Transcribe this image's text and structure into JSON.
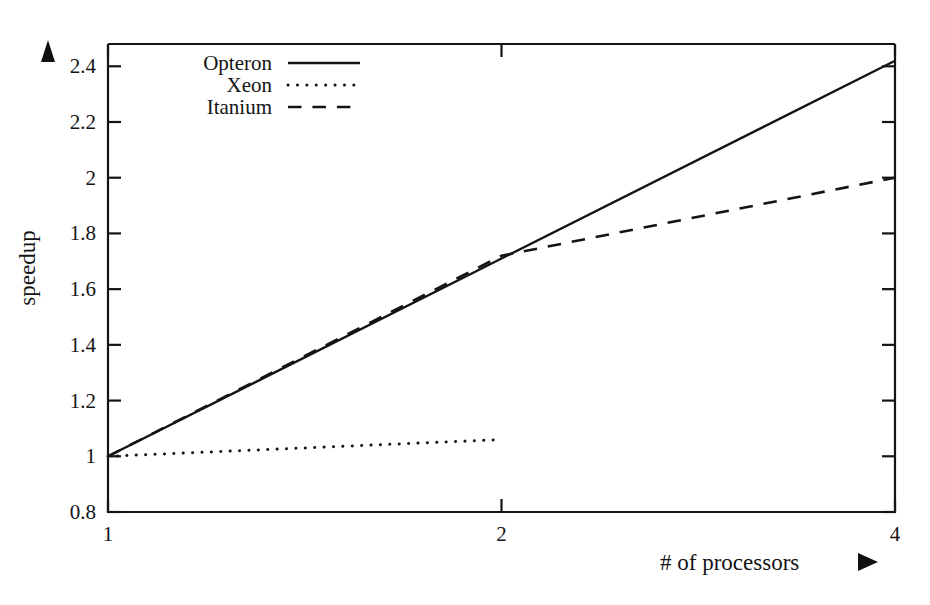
{
  "chart_data": {
    "type": "line",
    "title": "",
    "xlabel": "# of processors",
    "ylabel": "speedup",
    "xlim": [
      1,
      4
    ],
    "ylim": [
      0.8,
      2.48
    ],
    "grid": false,
    "legend_position": "top-left",
    "x_tick_labels": [
      "1",
      "2",
      "4"
    ],
    "x_tick_values": [
      1,
      2,
      4
    ],
    "y_tick_labels": [
      "0.8",
      "1",
      "1.2",
      "1.4",
      "1.6",
      "1.8",
      "2",
      "2.2",
      "2.4"
    ],
    "y_tick_values": [
      0.8,
      1.0,
      1.2,
      1.4,
      1.6,
      1.8,
      2.0,
      2.2,
      2.4
    ],
    "series": [
      {
        "name": "Opteron",
        "style": "solid",
        "x": [
          1,
          2,
          4
        ],
        "values": [
          1.0,
          1.71,
          2.42
        ]
      },
      {
        "name": "Xeon",
        "style": "dotted",
        "x": [
          1,
          2
        ],
        "values": [
          1.0,
          1.06
        ]
      },
      {
        "name": "Itanium",
        "style": "dashed",
        "x": [
          1,
          2,
          4
        ],
        "values": [
          1.0,
          1.72,
          2.0
        ]
      }
    ]
  },
  "axes": {
    "y_arrow": "up-arrow-marker",
    "x_arrow": "right-arrow-marker"
  },
  "legend": {
    "entries": [
      {
        "label": "Opteron",
        "style": "solid"
      },
      {
        "label": "Xeon",
        "style": "dotted"
      },
      {
        "label": "Itanium",
        "style": "dashed"
      }
    ]
  },
  "colors": {
    "ink": "#141414",
    "background": "#ffffff"
  }
}
